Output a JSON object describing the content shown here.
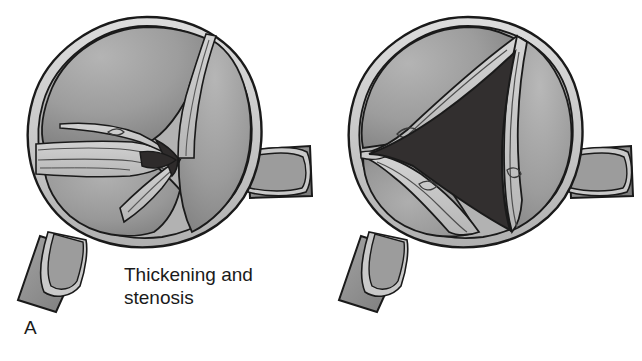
{
  "figure": {
    "background_color": "#ffffff",
    "panel_count": 2
  },
  "palette": {
    "outline": "#1a1a1a",
    "wall_light": "#cfcfcf",
    "wall_mid": "#a8a8a8",
    "cusp_fill": "#9c9c9c",
    "cusp_fill_dark": "#8a8a8a",
    "cusp_highlight": "#b9b9b9",
    "fibrous_band": "#c5c5c5",
    "orifice_dark": "#2e2b2b",
    "orifice_dark_b": "#322f2f",
    "stub_fill": "#8d8d8d",
    "text": "#1a1a1a"
  },
  "panels": [
    {
      "id": "A",
      "letter": "A",
      "caption": "Thickening and\nstenosis",
      "caption_lines": [
        "Thickening and",
        "stenosis"
      ],
      "condition": "aortic stenosis",
      "orifice": "small triangular slit",
      "orifice_size": "narrow",
      "cusp_description": "three thickened fibrosed cusps with fused commissures",
      "structures": [
        "aortic root wall",
        "right coronary ostium stub",
        "left coronary ostium stub",
        "anterior cusp",
        "right cusp",
        "posterior cusp",
        "stenotic orifice"
      ]
    },
    {
      "id": "B",
      "letter": "B",
      "caption": "Retracted\nfibrosed valve\ncusps",
      "caption_lines": [
        "Retracted",
        "fibrosed valve",
        "cusps"
      ],
      "condition": "aortic regurgitation",
      "orifice": "large triangular central opening",
      "orifice_size": "wide",
      "cusp_description": "three retracted fibrosed cusps pulled back toward the wall",
      "structures": [
        "aortic root wall",
        "right coronary ostium stub",
        "left coronary ostium stub",
        "retracted anterior cusp",
        "retracted right cusp",
        "retracted posterior cusp",
        "regurgitant orifice"
      ]
    }
  ]
}
